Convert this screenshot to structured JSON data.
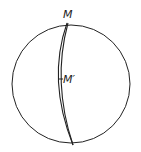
{
  "diagram": {
    "labels": {
      "top_point": "M",
      "mid_point": "M′"
    },
    "colors": {
      "stroke": "#222222",
      "background": "#ffffff"
    }
  }
}
